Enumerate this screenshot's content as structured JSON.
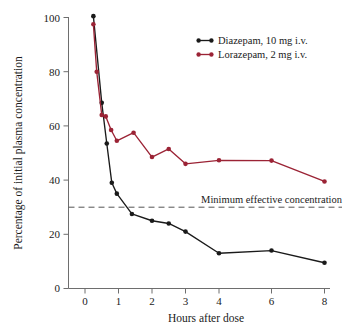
{
  "chart_data": {
    "type": "line",
    "title": "",
    "subtitle": "",
    "xlabel": "Hours after dose",
    "ylabel": "Percentage of initial plasma concentration",
    "xlim": [
      -0.55,
      8
    ],
    "ylim": [
      0,
      100
    ],
    "grid": false,
    "legend_position": "top-right",
    "x_tick_labels": [
      "0",
      "1",
      "2",
      "3",
      "4",
      "6",
      "8"
    ],
    "x_tick_values": [
      0,
      1,
      2,
      3,
      4,
      6,
      8
    ],
    "y_tick_labels": [
      "0",
      "20",
      "40",
      "60",
      "80",
      "100"
    ],
    "y_tick_values": [
      0,
      20,
      40,
      60,
      80,
      100
    ],
    "series": [
      {
        "name": "Diazepam, 10 mg i.v.",
        "color": "#1a1a1a",
        "marker": "circle",
        "x": [
          0.25,
          0.5,
          0.65,
          0.8,
          0.95,
          1.4,
          2.0,
          2.5,
          3.0,
          4.0,
          6.0,
          8.0
        ],
        "values": [
          100.5,
          68.5,
          53.5,
          39.0,
          35.0,
          27.5,
          25.0,
          24.0,
          21.0,
          13.0,
          14.0,
          9.5
        ]
      },
      {
        "name": "Lorazepam, 2 mg i.v.",
        "color": "#9B2335",
        "marker": "circle",
        "x": [
          0.25,
          0.35,
          0.5,
          0.62,
          0.78,
          0.95,
          1.45,
          2.0,
          2.5,
          3.0,
          4.0,
          6.0,
          8.0
        ],
        "values": [
          97.5,
          80.0,
          64.0,
          63.5,
          58.5,
          54.5,
          57.5,
          48.5,
          51.5,
          46.0,
          47.3,
          47.2,
          39.5
        ]
      }
    ],
    "annotations": [
      {
        "text": "Minimum effective concentration",
        "type": "threshold-line",
        "y_value": 30,
        "line_style": "dashed"
      }
    ]
  },
  "legend": {
    "entries": [
      {
        "label": "Diazepam, 10 mg i.v.",
        "color": "#1a1a1a"
      },
      {
        "label": "Lorazepam, 2 mg i.v.",
        "color": "#9B2335"
      }
    ]
  }
}
